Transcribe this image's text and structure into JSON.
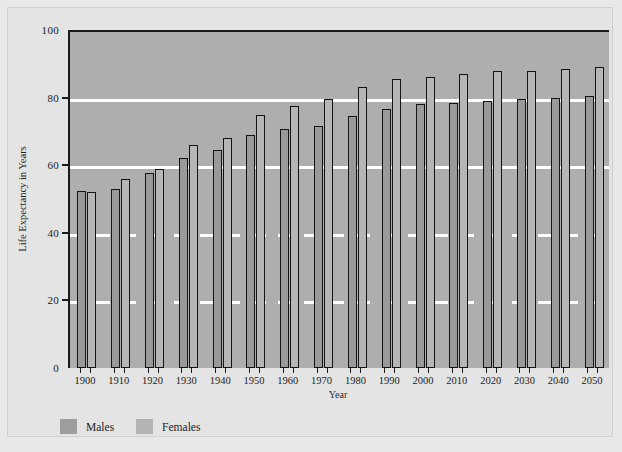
{
  "chart_data": {
    "type": "bar",
    "title": "",
    "subtitle": "",
    "xlabel": "Year",
    "ylabel": "Life Expectancy in Years",
    "categories": [
      "1900",
      "1910",
      "1920",
      "1930",
      "1940",
      "1950",
      "1960",
      "1970",
      "1980",
      "1990",
      "2000",
      "2010",
      "2020",
      "2030",
      "2040",
      "2050"
    ],
    "series": [
      {
        "name": "Males",
        "color": "#9a9a9a",
        "values": [
          52.5,
          53.0,
          57.8,
          62.0,
          64.5,
          69.0,
          70.8,
          71.5,
          74.5,
          76.5,
          78.0,
          78.5,
          79.0,
          79.5,
          80.0,
          80.5
        ]
      },
      {
        "name": "Females",
        "color": "#b6b6b6",
        "values": [
          52.0,
          56.0,
          59.0,
          66.0,
          68.0,
          75.0,
          77.5,
          79.5,
          83.0,
          85.5,
          86.2,
          87.0,
          87.8,
          88.0,
          88.5,
          89.0
        ]
      }
    ],
    "ylim": [
      0,
      100
    ],
    "yticks": [
      0,
      20,
      40,
      60,
      80,
      100
    ],
    "grid": true,
    "grid_color": "#ffffff",
    "legend_position": "below-bottom-left",
    "plot_background": "#aeaeae",
    "figure_background": "#e4e4e4"
  },
  "axes": {
    "y_title": "Life Expectancy in Years",
    "x_title": "Year",
    "y_tick_labels": [
      "0",
      "20",
      "40",
      "60",
      "80",
      "100"
    ],
    "x_tick_labels": [
      "1900",
      "1910",
      "1920",
      "1930",
      "1940",
      "1950",
      "1960",
      "1970",
      "1980",
      "1990",
      "2000",
      "2010",
      "2020",
      "2030",
      "2040",
      "2050"
    ]
  },
  "legend": {
    "items": [
      {
        "label": "Males",
        "color": "#9d9d9d"
      },
      {
        "label": "Females",
        "color": "#b4b4b4"
      }
    ]
  }
}
